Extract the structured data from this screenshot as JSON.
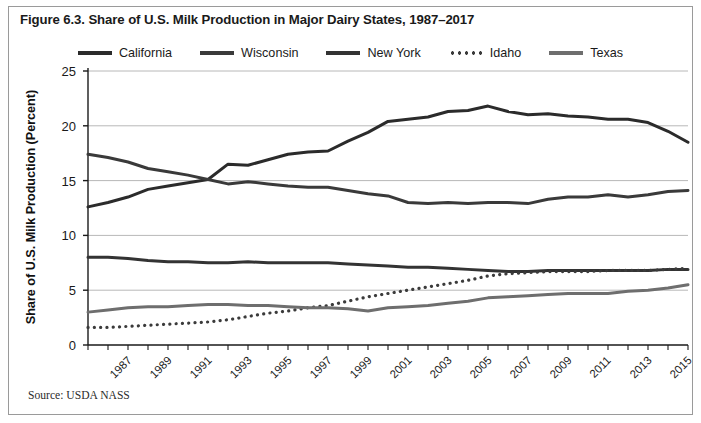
{
  "figure": {
    "title": "Figure 6.3. Share of U.S. Milk Production in Major Dairy States, 1987–2017",
    "source": "Source: USDA NASS"
  },
  "colors": {
    "california": "#2b2b2b",
    "wisconsin": "#3a3a3a",
    "new_york": "#333333",
    "idaho": "#3b3b3b",
    "texas": "#6e6e6e",
    "grid": "#b8b8b8",
    "axis": "#1a1a1a",
    "border": "#9a9a9a"
  },
  "chart_data": {
    "type": "line",
    "title": "Figure 6.3. Share of U.S. Milk Production in Major Dairy States, 1987–2017",
    "xlabel": "",
    "ylabel": "Share of U.S. Milk Production (Percent)",
    "ylim": [
      0,
      25
    ],
    "xlim": [
      1987,
      2017
    ],
    "yticks": [
      0,
      5,
      10,
      15,
      20,
      25
    ],
    "grid": "horizontal",
    "legend_position": "top-center",
    "xtick_labels": [
      "1987",
      "1989",
      "1991",
      "1993",
      "1995",
      "1997",
      "1999",
      "2001",
      "2003",
      "2005",
      "2007",
      "2009",
      "2011",
      "2013",
      "2015",
      "2017"
    ],
    "x": [
      1987,
      1988,
      1989,
      1990,
      1991,
      1992,
      1993,
      1994,
      1995,
      1996,
      1997,
      1998,
      1999,
      2000,
      2001,
      2002,
      2003,
      2004,
      2005,
      2006,
      2007,
      2008,
      2009,
      2010,
      2011,
      2012,
      2013,
      2014,
      2015,
      2016,
      2017
    ],
    "series": [
      {
        "name": "California",
        "style": "solid",
        "color": "#2b2b2b",
        "values": [
          12.6,
          13.0,
          13.5,
          14.2,
          14.5,
          14.8,
          15.1,
          16.5,
          16.4,
          16.9,
          17.4,
          17.6,
          17.7,
          18.6,
          19.4,
          20.4,
          20.6,
          20.8,
          21.3,
          21.4,
          21.8,
          21.3,
          21.0,
          21.1,
          20.9,
          20.8,
          20.6,
          20.6,
          20.3,
          19.5,
          18.5
        ]
      },
      {
        "name": "Wisconsin",
        "style": "solid",
        "color": "#3a3a3a",
        "values": [
          17.4,
          17.1,
          16.7,
          16.1,
          15.8,
          15.5,
          15.1,
          14.7,
          14.9,
          14.7,
          14.5,
          14.4,
          14.4,
          14.1,
          13.8,
          13.6,
          13.0,
          12.9,
          13.0,
          12.9,
          13.0,
          13.0,
          12.9,
          13.3,
          13.5,
          13.5,
          13.7,
          13.5,
          13.7,
          14.0,
          14.1
        ]
      },
      {
        "name": "New York",
        "style": "solid",
        "color": "#333333",
        "values": [
          8.0,
          8.0,
          7.9,
          7.7,
          7.6,
          7.6,
          7.5,
          7.5,
          7.6,
          7.5,
          7.5,
          7.5,
          7.5,
          7.4,
          7.3,
          7.2,
          7.1,
          7.1,
          7.0,
          6.9,
          6.8,
          6.7,
          6.7,
          6.8,
          6.8,
          6.8,
          6.8,
          6.8,
          6.8,
          6.9,
          6.9
        ]
      },
      {
        "name": "Idaho",
        "style": "dotted",
        "color": "#3b3b3b",
        "values": [
          1.6,
          1.6,
          1.7,
          1.8,
          1.9,
          2.0,
          2.1,
          2.3,
          2.6,
          2.9,
          3.1,
          3.4,
          3.6,
          4.0,
          4.4,
          4.7,
          5.0,
          5.3,
          5.6,
          5.9,
          6.3,
          6.5,
          6.6,
          6.7,
          6.7,
          6.7,
          6.8,
          6.8,
          6.8,
          6.9,
          7.0
        ]
      },
      {
        "name": "Texas",
        "style": "solid",
        "color": "#6e6e6e",
        "values": [
          3.0,
          3.2,
          3.4,
          3.5,
          3.5,
          3.6,
          3.7,
          3.7,
          3.6,
          3.6,
          3.5,
          3.4,
          3.4,
          3.3,
          3.1,
          3.4,
          3.5,
          3.6,
          3.8,
          4.0,
          4.3,
          4.4,
          4.5,
          4.6,
          4.7,
          4.7,
          4.7,
          4.9,
          5.0,
          5.2,
          5.5
        ]
      }
    ]
  },
  "legend": {
    "items": [
      {
        "label": "California",
        "style": "solid"
      },
      {
        "label": "Wisconsin",
        "style": "solid"
      },
      {
        "label": "New York",
        "style": "solid"
      },
      {
        "label": "Idaho",
        "style": "dotted"
      },
      {
        "label": "Texas",
        "style": "solid"
      }
    ]
  }
}
